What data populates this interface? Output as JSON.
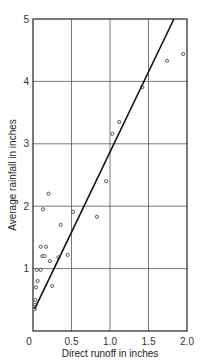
{
  "chart_data": {
    "type": "scatter",
    "title": "",
    "xlabel": "Direct runoff in inches",
    "ylabel": "Average rainfall in inches",
    "xlim": [
      0,
      2.0
    ],
    "ylim": [
      0,
      5
    ],
    "x_ticks": [
      "0",
      "0.5",
      "1.0",
      "1.5",
      "2.0"
    ],
    "y_ticks": [
      "1",
      "2",
      "3",
      "4",
      "5"
    ],
    "grid": true,
    "legend": null,
    "series": [
      {
        "name": "observations",
        "marker": "open-circle",
        "points": [
          [
            0.02,
            0.35
          ],
          [
            0.03,
            0.42
          ],
          [
            0.03,
            0.5
          ],
          [
            0.04,
            0.7
          ],
          [
            0.06,
            0.8
          ],
          [
            0.05,
            0.98
          ],
          [
            0.1,
            0.98
          ],
          [
            0.12,
            1.2
          ],
          [
            0.1,
            1.35
          ],
          [
            0.15,
            1.2
          ],
          [
            0.17,
            1.35
          ],
          [
            0.13,
            1.95
          ],
          [
            0.2,
            2.2
          ],
          [
            0.25,
            0.72
          ],
          [
            0.22,
            1.12
          ],
          [
            0.33,
            1.18
          ],
          [
            0.36,
            1.7
          ],
          [
            0.45,
            1.22
          ],
          [
            0.52,
            1.91
          ],
          [
            0.83,
            1.83
          ],
          [
            0.95,
            2.4
          ],
          [
            1.03,
            3.16
          ],
          [
            1.12,
            3.35
          ],
          [
            1.42,
            3.91
          ],
          [
            1.74,
            4.33
          ],
          [
            1.95,
            4.44
          ]
        ]
      },
      {
        "name": "fitted line",
        "type": "line",
        "points": [
          [
            0.02,
            0.35
          ],
          [
            1.83,
            5.0
          ]
        ]
      }
    ]
  },
  "labels": {
    "x_axis": "Direct runoff in inches",
    "y_axis": "Average rainfall in inches",
    "x_ticks": [
      "0",
      "0.5",
      "1.0",
      "1.5",
      "2.0"
    ],
    "y_ticks": [
      "1",
      "2",
      "3",
      "4",
      "5"
    ]
  }
}
